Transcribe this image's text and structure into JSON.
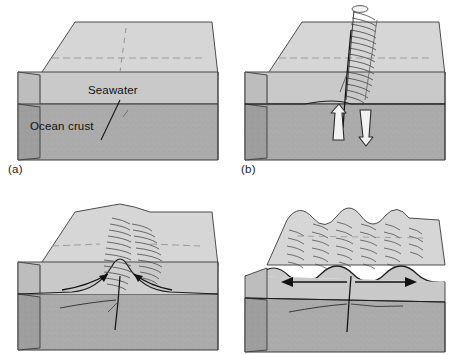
{
  "figure": {
    "type": "diagram",
    "panel_count": 4,
    "colors": {
      "top_face": "#d6d6d6",
      "seawater_front": "#c9c9c9",
      "seawater_side": "#bdbdbd",
      "crust_front": "#ababab",
      "crust_side": "#9e9e9e",
      "outline": "#3a3a3a",
      "arrow_black": "#111111",
      "arrow_white_fill": "#f2f2f2",
      "hatch": "#4a4a4a",
      "background": "#ffffff"
    }
  },
  "panels": [
    {
      "id": "a",
      "label": "(a)",
      "label_visible": true,
      "caption_labels": {
        "seawater": "Seawater",
        "ocean_crust": "Ocean crust"
      },
      "features": {
        "seafloor": "flat",
        "fracture": "faint vertical dashed crack through centre",
        "plume": "none",
        "arrows": "none"
      }
    },
    {
      "id": "b",
      "label": "(b)",
      "label_visible": true,
      "features": {
        "seafloor": "flat",
        "fracture": "open vertical fissure at centre",
        "plume": "tall hatched hydrothermal plume rising to sea surface",
        "arrows": "two white block arrows, left pointing up, right pointing down (circulating seawater)"
      }
    },
    {
      "id": "c",
      "label": "",
      "label_visible": false,
      "features": {
        "seafloor": "single central ridge built up over the fissure",
        "fracture": "vertical crack beneath ridge crest",
        "plume": "hatched shading on ridge flanks",
        "arrows": "two curved black arrows converging upward on the ridge crest"
      }
    },
    {
      "id": "d",
      "label": "",
      "label_visible": false,
      "features": {
        "seafloor": "four wavy ridge crests across the whole block",
        "fracture": "vertical crack at centre",
        "plume": "hatched shading over all ridge crests",
        "arrows": "double-headed horizontal arrow showing spreading away from centre"
      }
    }
  ]
}
